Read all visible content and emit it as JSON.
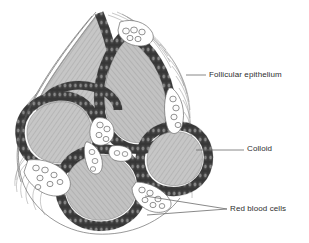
{
  "figure": {
    "background_color": "#ffffff",
    "width": 309,
    "height": 243
  },
  "labels": [
    {
      "id": "follicular-epithelium",
      "text": "Follicular epithelium",
      "x": 209,
      "y": 70,
      "leader": {
        "x1": 186,
        "y1": 75,
        "x2": 206,
        "y2": 75
      }
    },
    {
      "id": "colloid",
      "text": "Colloid",
      "x": 247,
      "y": 144,
      "leader": {
        "x1": 196,
        "y1": 150,
        "x2": 244,
        "y2": 150
      }
    },
    {
      "id": "red-blood-cells",
      "text": "Red blood cells",
      "x": 230,
      "y": 204,
      "leader_a": {
        "x1": 145,
        "y1": 196,
        "x2": 227,
        "y2": 209
      },
      "leader_b": {
        "x1": 147,
        "y1": 214,
        "x2": 227,
        "y2": 209
      }
    }
  ],
  "colors": {
    "epithelium_dark": "#3b3b3b",
    "epithelium_nucleus": "#8f8f8f",
    "colloid_fill": "#c4c4c4",
    "colloid_hatch": "#a8a8a8",
    "interstitium": "#ffffff",
    "rbc_outline": "#555555",
    "stroma_line": "#707070",
    "text": "#2e2e2e",
    "leader_line": "#6b6b6b"
  },
  "structures": {
    "follicles": [
      {
        "name": "follicle-upper-left",
        "cx": 74,
        "cy": 58
      },
      {
        "name": "follicle-upper-center",
        "cx": 133,
        "cy": 72
      },
      {
        "name": "follicle-mid-left",
        "cx": 55,
        "cy": 128
      },
      {
        "name": "follicle-lower-center",
        "cx": 104,
        "cy": 182
      },
      {
        "name": "follicle-right",
        "cx": 180,
        "cy": 152
      }
    ],
    "capillary_spaces": [
      {
        "name": "capillary-upper-right",
        "cx": 170,
        "cy": 114
      },
      {
        "name": "capillary-center",
        "cx": 100,
        "cy": 131
      },
      {
        "name": "capillary-lower-left",
        "cx": 48,
        "cy": 160
      },
      {
        "name": "capillary-lower-right",
        "cx": 152,
        "cy": 198
      },
      {
        "name": "capillary-top",
        "cx": 134,
        "cy": 32
      }
    ]
  }
}
